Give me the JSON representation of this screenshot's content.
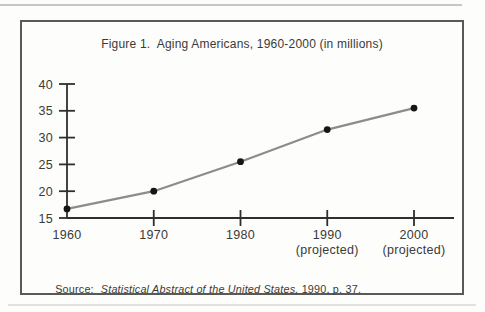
{
  "figure": {
    "title": "Figure 1.  Aging Americans, 1960-2000 (in millions)",
    "source": {
      "label": "Source:",
      "work_italic": "Statistical Abstract of the United States,",
      "detail": " 1990, p. 37."
    }
  },
  "colors": {
    "background": "#fdfdfb",
    "frame_border": "#595955",
    "axis": "#2f2f2d",
    "text": "#3a3a38",
    "line": "#8c8c8a",
    "point": "#161614"
  },
  "chart_data": {
    "type": "line",
    "title": "Figure 1.  Aging Americans, 1960-2000 (in millions)",
    "x_tick_labels": [
      "1960",
      "1970",
      "1980",
      "1990",
      "2000"
    ],
    "x_tick_sublabels": [
      "",
      "",
      "",
      "(projected)",
      "(projected)"
    ],
    "values": [
      16.7,
      20,
      25.5,
      31.5,
      35.5
    ],
    "y_ticks": [
      15,
      20,
      25,
      30,
      35,
      40
    ],
    "ylim": [
      15,
      40
    ],
    "xlabel": "",
    "ylabel": "",
    "grid": false,
    "legend": false,
    "line_color": "#8c8c8a",
    "point_color": "#161614"
  }
}
